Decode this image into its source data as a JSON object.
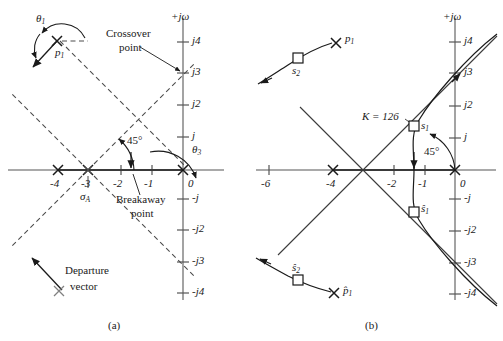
{
  "figure": {
    "type": "root-locus-diagram",
    "panels": [
      {
        "id": "a",
        "caption": "(a)",
        "axis": {
          "imag_label": "+jω",
          "real_ticks": [
            "-4",
            "-3",
            "-2",
            "-1",
            "0"
          ],
          "imag_ticks_positive": [
            "j4",
            "j3",
            "j2",
            "j"
          ],
          "imag_ticks_negative": [
            "-j",
            "-j2",
            "-j3",
            "-j4"
          ]
        },
        "annotations": {
          "theta1": "θ1",
          "theta3": "θ3",
          "p1": "p1",
          "sigma_a": "σA",
          "angle45": "45°",
          "crossover": "Crossover\npoint",
          "crossover_line1": "Crossover",
          "crossover_line2": "point",
          "breakaway_line1": "Breakaway",
          "breakaway_line2": "point",
          "legend_line1": "Departure",
          "legend_line2": "vector"
        }
      },
      {
        "id": "b",
        "caption": "(b)",
        "axis": {
          "imag_label": "+jω",
          "real_ticks": [
            "-6",
            "-4",
            "-2",
            "-1",
            "0"
          ],
          "imag_ticks_positive": [
            "j4",
            "j3",
            "j2",
            "j"
          ],
          "imag_ticks_negative": [
            "-j",
            "-j2",
            "-j3",
            "-j4"
          ]
        },
        "annotations": {
          "gain": "K = 126",
          "s1": "s1",
          "s2": "s2",
          "s1_hat": "ŝ1",
          "s2_hat": "ŝ2",
          "p1": "p1",
          "p1_hat": "p̂1",
          "angle45": "45°"
        }
      }
    ],
    "colors": {
      "axis": "#808080",
      "locus": "#1a1a1a",
      "dashed": "#4d4d4d",
      "text": "#1a1a1a"
    }
  },
  "chart_data": {
    "type": "scatter",
    "title": "",
    "xlabel": "Real axis (σ)",
    "ylabel": "Imaginary axis (jω)",
    "panels": [
      {
        "name": "(a)",
        "xlim": [
          -4.8,
          0.8
        ],
        "ylim": [
          -4.6,
          4.8
        ],
        "xticks": [
          -4,
          -3,
          -2,
          -1,
          0
        ],
        "yticks": [
          -4,
          -3,
          -2,
          -1,
          1,
          2,
          3,
          4
        ],
        "poles": [
          {
            "label": "p1",
            "x": -3.6,
            "y": 4.7,
            "marker": "x"
          },
          {
            "label": "",
            "x": -4,
            "y": 0,
            "marker": "x"
          },
          {
            "label": "",
            "x": -3,
            "y": 0,
            "marker": "x"
          },
          {
            "label": "",
            "x": 0,
            "y": 0,
            "marker": "x"
          }
        ],
        "asymptote_centroid": {
          "label": "σA",
          "x": -3,
          "y": 0
        },
        "asymptote_angle_deg": 45,
        "breakaway_point": {
          "label": "Breakaway point",
          "x": -1.6,
          "y": 0
        },
        "crossover_point": {
          "label": "Crossover point",
          "x": 0,
          "y": 3
        },
        "departure_angle": {
          "label": "θ1",
          "from_pole": "p1"
        },
        "angle_theta3": {
          "label": "θ3",
          "at": [
            0,
            0
          ]
        },
        "legend": {
          "label": "Departure vector",
          "marker": "x-with-arrow"
        }
      },
      {
        "name": "(b)",
        "xlim": [
          -6.8,
          0.9
        ],
        "ylim": [
          -4.6,
          4.8
        ],
        "xticks": [
          -6,
          -4,
          -2,
          -1,
          0
        ],
        "yticks": [
          -4,
          -3,
          -2,
          -1,
          1,
          2,
          3,
          4
        ],
        "poles": [
          {
            "label": "p1",
            "x": -3.9,
            "y": 4.2,
            "marker": "x"
          },
          {
            "label": "p1hat",
            "x": -4.0,
            "y": -4.0,
            "marker": "x"
          },
          {
            "label": "",
            "x": -4,
            "y": 0,
            "marker": "x"
          },
          {
            "label": "",
            "x": 0,
            "y": 0,
            "marker": "x"
          }
        ],
        "markers": [
          {
            "label": "s1",
            "x": -1.35,
            "y": 1.42,
            "marker": "square",
            "gain": 126
          },
          {
            "label": "s1hat",
            "x": -1.35,
            "y": -1.35,
            "marker": "square"
          },
          {
            "label": "s2",
            "x": -5.1,
            "y": 3.6,
            "marker": "square"
          },
          {
            "label": "s2hat",
            "x": -5.1,
            "y": -3.6,
            "marker": "square"
          }
        ],
        "gain_annotation": {
          "label": "K = 126",
          "value": 126
        },
        "damping_line_angle_deg": 45
      }
    ]
  }
}
